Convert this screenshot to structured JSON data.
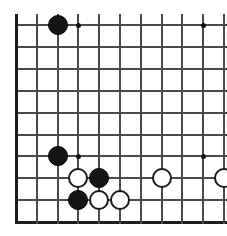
{
  "diagram": {
    "title": "Go board position diagram",
    "board_type": "go-board",
    "caption": ""
  },
  "board": {
    "columns": 10,
    "rows": 10,
    "origin_x": 16,
    "origin_y": 25,
    "cell_width": 20.8,
    "cell_height": 21.9,
    "line_color": "#4a4a4a",
    "edge_color": "#1c1c1c",
    "background_color": "#ffffff",
    "cropped_edges": [
      "top",
      "right"
    ],
    "border_edges": [
      "left",
      "bottom"
    ],
    "stone_radius": 10,
    "star_points": [
      {
        "col": 3,
        "row": 0,
        "label": "star-point-upper-left"
      },
      {
        "col": 9,
        "row": 0,
        "label": "star-point-upper-right"
      },
      {
        "col": 3,
        "row": 6,
        "label": "star-point-lower-left"
      },
      {
        "col": 9,
        "row": 6,
        "label": "star-point-lower-right"
      }
    ],
    "stones": [
      {
        "col": 2,
        "row": 0,
        "color": "black",
        "label": "black-stone-top-left"
      },
      {
        "col": 2,
        "row": 6,
        "color": "black",
        "label": "black-stone-left-side"
      },
      {
        "col": 3,
        "row": 7,
        "color": "white",
        "label": "white-stone-lower-left-a"
      },
      {
        "col": 4,
        "row": 7,
        "color": "black",
        "label": "black-stone-lower-center"
      },
      {
        "col": 7,
        "row": 7,
        "color": "white",
        "label": "white-stone-lower-right-a"
      },
      {
        "col": 10,
        "row": 7,
        "color": "white",
        "label": "white-stone-right-edge"
      },
      {
        "col": 3,
        "row": 8,
        "color": "black",
        "label": "black-stone-bottom-left"
      },
      {
        "col": 4,
        "row": 8,
        "color": "white",
        "label": "white-stone-bottom-a"
      },
      {
        "col": 5,
        "row": 8,
        "color": "white",
        "label": "white-stone-bottom-b"
      }
    ]
  },
  "counts": {
    "black_stones": 4,
    "white_stones": 5,
    "total_stones": 9
  }
}
